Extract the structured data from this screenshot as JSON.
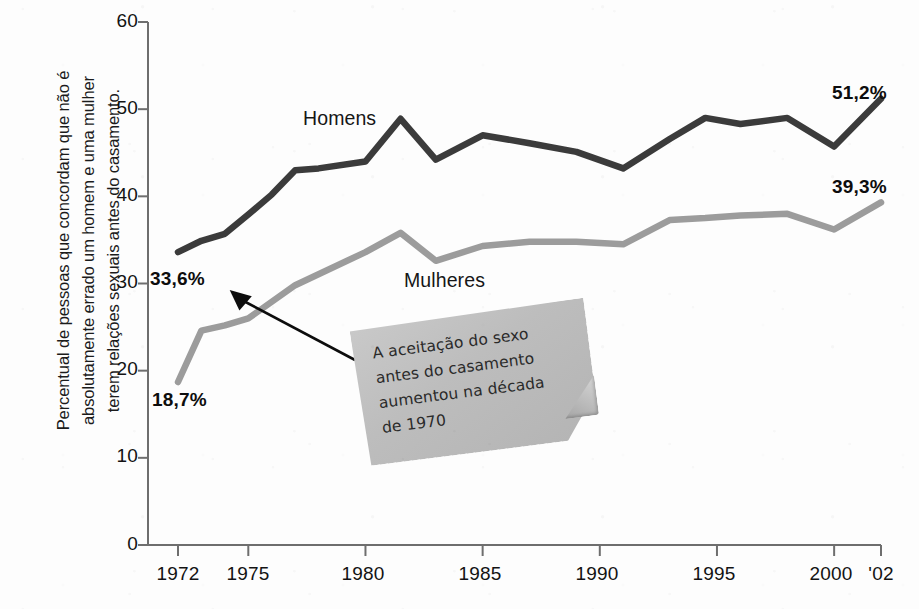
{
  "chart_data": {
    "type": "line",
    "title": "",
    "subtitle": "",
    "xlabel": "",
    "ylabel": "Percentual de pessoas que concordam que não é absolutamente errado um homem e uma mulher terem relações sexuais antes do casamento.",
    "ylabel_lines": [
      "Percentual de pessoas que concordam que não é",
      "absolutamente errado um homem e uma mulher",
      "terem relações sexuais antes do casamento."
    ],
    "xlim": [
      1972,
      2002
    ],
    "ylim": [
      0,
      60
    ],
    "ytick_labels": [
      "60",
      "50",
      "40",
      "30",
      "20",
      "10",
      "0"
    ],
    "ytick_values": [
      60,
      50,
      40,
      30,
      20,
      10,
      0
    ],
    "xtick_labels": [
      "1972",
      "1975",
      "1980",
      "1985",
      "1990",
      "1995",
      "2000",
      "'02"
    ],
    "xtick_values": [
      1972,
      1975,
      1980,
      1985,
      1990,
      1995,
      2000,
      2002
    ],
    "grid": false,
    "legend_position": "inline-annotations",
    "series": [
      {
        "name": "Homens",
        "color": "#3b3b3b",
        "label_start": "33,6%",
        "label_end": "51,2%",
        "x": [
          1972,
          1973,
          1974,
          1975,
          1976,
          1977,
          1978,
          1980,
          1981.5,
          1983,
          1985,
          1987,
          1989,
          1991,
          1993,
          1994.5,
          1996,
          1998,
          2000,
          2002
        ],
        "values": [
          33.6,
          34.9,
          35.7,
          37.9,
          40.2,
          43.0,
          43.2,
          44.0,
          48.9,
          44.2,
          47.0,
          46.1,
          45.1,
          43.2,
          46.6,
          49.0,
          48.3,
          49.0,
          45.7,
          51.2
        ]
      },
      {
        "name": "Mulheres",
        "color": "#9c9c9c",
        "label_start": "18,7%",
        "label_end": "39,3%",
        "x": [
          1972,
          1973,
          1974,
          1975,
          1977,
          1980,
          1981.5,
          1983,
          1985,
          1987,
          1989,
          1991,
          1993,
          1994.5,
          1996,
          1998,
          2000,
          2002
        ],
        "values": [
          18.7,
          24.6,
          25.2,
          26.0,
          29.8,
          33.6,
          35.8,
          32.6,
          34.3,
          34.8,
          34.8,
          34.5,
          37.3,
          37.5,
          37.8,
          38.0,
          36.2,
          39.3
        ]
      }
    ],
    "annotations": [
      {
        "name": "callout-note",
        "lines": [
          "A aceitação do sexo",
          "antes do casamento",
          "aumentou na década",
          "de 1970"
        ],
        "text": "A aceitação do sexo antes do casamento aumentou na década de 1970",
        "style": "sticky-note",
        "color": "#bdbdbd",
        "points_to": "33,6%"
      },
      {
        "name": "arrow-to-33-6",
        "type": "arrow",
        "from": "callout-note",
        "to": "33,6%"
      }
    ],
    "colors": {
      "homens_line": "#3b3b3b",
      "mulheres_line": "#9c9c9c",
      "axis": "#6e6e6e",
      "text": "#131313",
      "note_fill": "#bdbdbd",
      "background": "#fdfdfd"
    }
  }
}
